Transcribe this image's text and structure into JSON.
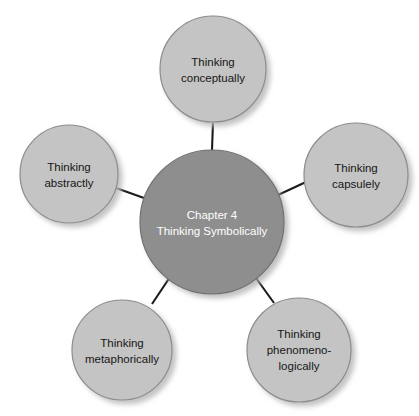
{
  "diagram": {
    "type": "radial-hub-and-spoke",
    "background_color": "#ffffff",
    "center": {
      "name": "center-node",
      "fill": "#8e8e8e",
      "stroke": "#6f6f6f",
      "text_color": "#ffffff",
      "cx": 212,
      "cy": 222,
      "r": 72,
      "lines": [
        "Chapter 4",
        "Thinking Symbolically"
      ],
      "line1": "Chapter 4",
      "line2": "Thinking Symbolically"
    },
    "satellite_style": {
      "fill": "#c4c4c4",
      "stroke": "#8c8c8c",
      "text_color": "#161616",
      "shadow_color": "#d8d8d8"
    },
    "connector_color": "#1c1c1c",
    "nodes": [
      {
        "id": "thinking-conceptually",
        "position": "top",
        "cx": 213,
        "cy": 69,
        "r": 53,
        "lines": [
          "Thinking",
          "conceptually"
        ],
        "line1": "Thinking",
        "line2": "conceptually",
        "line3": ""
      },
      {
        "id": "thinking-capsulely",
        "position": "right",
        "cx": 356,
        "cy": 175,
        "r": 52,
        "lines": [
          "Thinking",
          "capsulely"
        ],
        "line1": "Thinking",
        "line2": "capsulely",
        "line3": ""
      },
      {
        "id": "thinking-phenomenologically",
        "position": "bottom-right",
        "cx": 299,
        "cy": 350,
        "r": 52,
        "lines": [
          "Thinking",
          "phenomeno-",
          "logically"
        ],
        "line1": "Thinking",
        "line2": "phenomeno-",
        "line3": "logically"
      },
      {
        "id": "thinking-metaphorically",
        "position": "bottom-left",
        "cx": 122,
        "cy": 350,
        "r": 50,
        "lines": [
          "Thinking",
          "metaphorically"
        ],
        "line1": "Thinking",
        "line2": "metaphorically",
        "line3": ""
      },
      {
        "id": "thinking-abstractly",
        "position": "left",
        "cx": 69,
        "cy": 174,
        "r": 49,
        "lines": [
          "Thinking",
          "abstractly"
        ],
        "line1": "Thinking",
        "line2": "abstractly",
        "line3": ""
      }
    ],
    "connectors": [
      {
        "id": "connector-center-to-conceptually",
        "x1": 212,
        "y1": 150,
        "x2": 213,
        "y2": 122
      },
      {
        "id": "connector-center-to-capsulely",
        "x1": 278,
        "y1": 195,
        "x2": 305,
        "y2": 182
      },
      {
        "id": "connector-center-to-phenomenologically",
        "x1": 256,
        "y1": 278,
        "x2": 274,
        "y2": 303
      },
      {
        "id": "connector-center-to-metaphorically",
        "x1": 170,
        "y1": 277,
        "x2": 152,
        "y2": 304
      },
      {
        "id": "connector-center-to-abstractly",
        "x1": 144,
        "y1": 198,
        "x2": 117,
        "y2": 188
      }
    ]
  }
}
